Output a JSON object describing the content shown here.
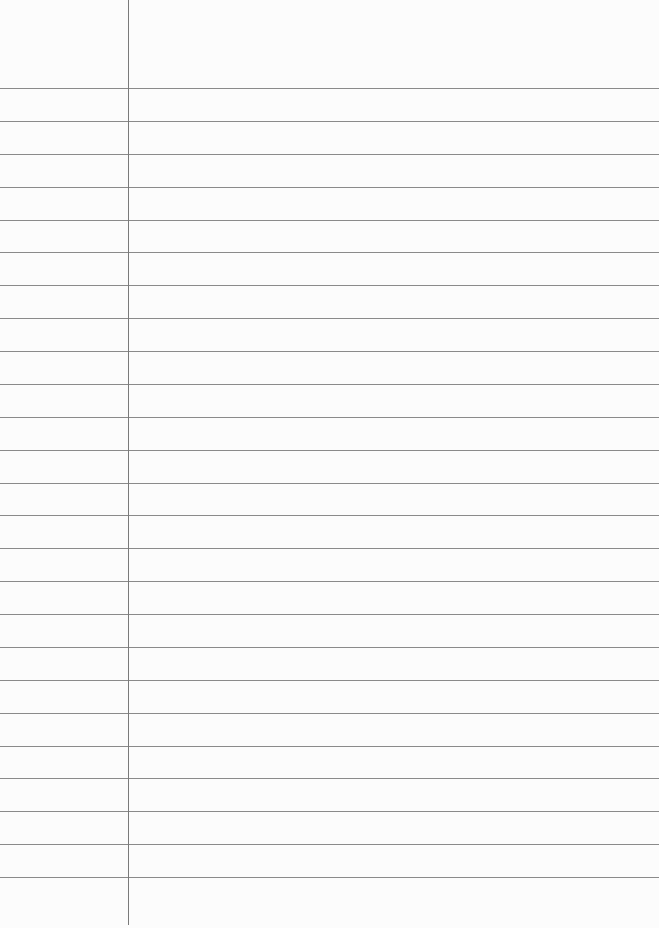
{
  "paper": {
    "type": "lined-paper",
    "rule_count": 25,
    "first_rule_y": 88,
    "rule_spacing": 32.875,
    "margin_x": 128,
    "rule_color": "#8a8a8a",
    "margin_color": "#7a7a7a",
    "background": "#fcfcfc"
  }
}
